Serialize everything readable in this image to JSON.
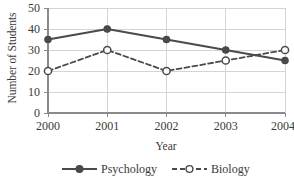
{
  "chart_data": {
    "type": "line",
    "title": "",
    "xlabel": "Year",
    "ylabel": "Number of Students",
    "categories": [
      "2000",
      "2001",
      "2002",
      "2003",
      "2004"
    ],
    "ylim": [
      0,
      50
    ],
    "yticks": [
      0,
      10,
      20,
      30,
      40,
      50
    ],
    "ytick_labels": [
      "0",
      "10",
      "20",
      "30",
      "40",
      "50"
    ],
    "grid": true,
    "legend_position": "bottom",
    "series": [
      {
        "name": "Psychology",
        "values": [
          35,
          40,
          35,
          30,
          25
        ],
        "color": "#4a4a4a",
        "linestyle": "solid",
        "marker": "filled-circle"
      },
      {
        "name": "Biology",
        "values": [
          20,
          30,
          20,
          25,
          30
        ],
        "color": "#4a4a4a",
        "linestyle": "dashed",
        "marker": "open-circle"
      }
    ]
  },
  "axis": {
    "y_title": "Number of Students",
    "x_title": "Year",
    "y_tick_0": "0",
    "y_tick_1": "10",
    "y_tick_2": "20",
    "y_tick_3": "30",
    "y_tick_4": "40",
    "y_tick_5": "50",
    "x_tick_0": "2000",
    "x_tick_1": "2001",
    "x_tick_2": "2002",
    "x_tick_3": "2003",
    "x_tick_4": "2004"
  },
  "legend": {
    "entry_0_label": "Psychology",
    "entry_1_label": "Biology"
  },
  "colors": {
    "series_line": "#4a4a4a",
    "gridline": "#d4d4d4",
    "axis": "#8a8a8a",
    "text": "#3a3a3a",
    "background": "#ffffff",
    "marker_open_fill": "#ffffff"
  }
}
